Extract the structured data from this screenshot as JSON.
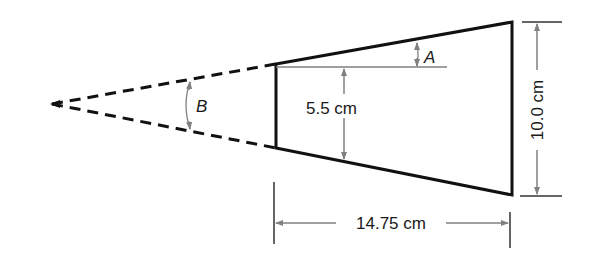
{
  "diagram": {
    "type": "geometry-trapezoid-taper",
    "colors": {
      "outline": "#111111",
      "dimension": "#808080",
      "text": "#1a1a1a",
      "background": "#ffffff"
    },
    "labels": {
      "angle_a": "A",
      "angle_b": "B",
      "inner_height": "5.5 cm",
      "right_height": "10.0 cm",
      "length": "14.75 cm"
    },
    "dimensions": {
      "inner_half_height_cm": 5.5,
      "right_side_height_cm": 10.0,
      "length_cm": 14.75
    }
  }
}
